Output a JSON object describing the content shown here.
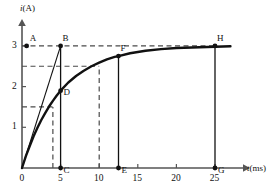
{
  "figure": {
    "type": "physics-current-vs-time-graph",
    "axes": {
      "y_label": "i(A)",
      "y_label_italic_part": "i",
      "y_label_rest": "(A)",
      "x_label": "t(ms)",
      "x_label_italic_part": "t",
      "x_label_rest": "(ms)",
      "x_ticks": [
        "0",
        "5",
        "10",
        "15",
        "20",
        "25"
      ],
      "x_tick_values": [
        0,
        5,
        10,
        15,
        20,
        25
      ],
      "y_ticks": [
        "1",
        "2",
        "3"
      ],
      "y_tick_values": [
        1,
        2,
        3
      ],
      "x_range": [
        0,
        27
      ],
      "y_range": [
        0,
        3.35
      ]
    },
    "point_labels": [
      {
        "name": "A",
        "text": "A",
        "x": 0.6,
        "y": 3.0
      },
      {
        "name": "B",
        "text": "B",
        "x": 5.0,
        "y": 3.0
      },
      {
        "name": "C",
        "text": "C",
        "x": 5.0,
        "y": 0.0
      },
      {
        "name": "D",
        "text": "D",
        "x": 5.0,
        "y": 1.9
      },
      {
        "name": "E",
        "text": "E",
        "x": 12.5,
        "y": 0.0
      },
      {
        "name": "F",
        "text": "F",
        "x": 12.5,
        "y": 2.75
      },
      {
        "name": "G",
        "text": "G",
        "x": 25.0,
        "y": 0.0
      },
      {
        "name": "H",
        "text": "H",
        "x": 25.0,
        "y": 3.0
      }
    ]
  },
  "chart_data": {
    "type": "line",
    "title": "",
    "xlabel": "t(ms)",
    "ylabel": "i(A)",
    "xlim": [
      0,
      27
    ],
    "ylim": [
      0,
      3.35
    ],
    "grid": false,
    "legend": "none",
    "series": [
      {
        "name": "charging-current-curve",
        "style": "solid-thick",
        "description": "exponential rise i = 3(1 - e^(-t/5)) approaching asymptote 3 A",
        "x": [
          0,
          0.5,
          1,
          1.5,
          2,
          2.5,
          3,
          3.5,
          4,
          4.5,
          5,
          6,
          7,
          8,
          9,
          10,
          11,
          12,
          12.5,
          14,
          16,
          18,
          20,
          22,
          25,
          27
        ],
        "y": [
          0,
          0.29,
          0.54,
          0.78,
          0.99,
          1.18,
          1.35,
          1.51,
          1.65,
          1.78,
          1.9,
          2.1,
          2.26,
          2.39,
          2.5,
          2.59,
          2.67,
          2.73,
          2.75,
          2.82,
          2.88,
          2.92,
          2.95,
          2.96,
          2.98,
          2.99
        ]
      },
      {
        "name": "initial-tangent-line",
        "style": "solid-thin",
        "description": "tangent at origin reaching asymptote value 3 A at t = 5 ms (point B)",
        "x": [
          0,
          5
        ],
        "y": [
          0,
          3
        ]
      }
    ],
    "asymptote": {
      "value": 3,
      "label": "3 A"
    },
    "time_constant_ms": 5,
    "dashed_horizontal_lines": [
      {
        "value": 3.0,
        "from_x": 0,
        "to_x": 25,
        "label": "3 A steady-state through A, B, H"
      },
      {
        "value": 2.5,
        "from_x": 0,
        "to_x": 10,
        "label": "2.5 A level at t = 10 ms"
      },
      {
        "value": 1.5,
        "from_x": 0,
        "to_x": 4,
        "label": "1.5 A level at t = 4 ms"
      }
    ],
    "dashed_vertical_lines": [
      {
        "value": 4.0,
        "from_y": 0,
        "to_y": 1.5
      },
      {
        "value": 10.0,
        "from_y": 0,
        "to_y": 2.5
      }
    ],
    "solid_vertical_lines": [
      {
        "value": 5.0,
        "from_y": 0,
        "to_y": 3.0,
        "label": "B to C"
      },
      {
        "value": 12.5,
        "from_y": 0,
        "to_y": 2.75,
        "label": "F to E"
      },
      {
        "value": 25.0,
        "from_y": 0,
        "to_y": 3.0,
        "label": "H to G"
      }
    ],
    "marked_points": [
      {
        "label": "A",
        "x": 0.6,
        "y": 3.0,
        "filled": true
      },
      {
        "label": "B",
        "x": 5.0,
        "y": 3.0,
        "filled": true
      },
      {
        "label": "C",
        "x": 5.0,
        "y": 0.0,
        "filled": true
      },
      {
        "label": "D",
        "x": 5.0,
        "y": 1.9,
        "filled": true
      },
      {
        "label": "E",
        "x": 12.5,
        "y": 0.0,
        "filled": true
      },
      {
        "label": "F",
        "x": 12.5,
        "y": 2.75,
        "filled": true
      },
      {
        "label": "G",
        "x": 25.0,
        "y": 0.0,
        "filled": true
      },
      {
        "label": "H",
        "x": 25.0,
        "y": 3.0,
        "filled": true
      }
    ],
    "colors": {
      "axis": "#555555",
      "curve": "#111111",
      "dashed": "#4a4a4a",
      "text": "#111111",
      "background": "#ffffff"
    }
  }
}
